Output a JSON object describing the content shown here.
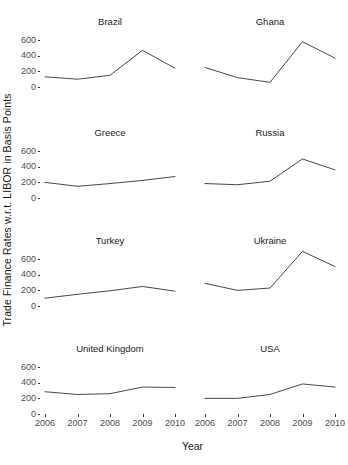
{
  "chart_data": {
    "type": "line",
    "title": "",
    "xlabel": "Year",
    "ylabel": "Trade Finance Rates w.r.t. LIBOR in Basis Points",
    "x": [
      2006,
      2007,
      2008,
      2009,
      2010
    ],
    "xtick_labels": [
      "2006",
      "2007",
      "2008",
      "2009",
      "2010"
    ],
    "ytick_labels": [
      "0",
      "200",
      "400",
      "600"
    ],
    "ytick_values": [
      0,
      200,
      400,
      600
    ],
    "ylim": [
      0,
      730
    ],
    "xlim": [
      2006,
      2010
    ],
    "grid": false,
    "legend": "none",
    "layout": "facet-grid 4 rows x 2 columns",
    "line_color": "#333333",
    "panels": [
      {
        "title": "Brazil",
        "row": 0,
        "col": 0,
        "values": [
          130,
          100,
          150,
          470,
          240
        ]
      },
      {
        "title": "Ghana",
        "row": 0,
        "col": 1,
        "values": [
          250,
          120,
          60,
          580,
          370
        ]
      },
      {
        "title": "Greece",
        "row": 1,
        "col": 0,
        "values": [
          200,
          150,
          185,
          225,
          275
        ]
      },
      {
        "title": "Russia",
        "row": 1,
        "col": 1,
        "values": [
          185,
          170,
          215,
          500,
          360
        ]
      },
      {
        "title": "Turkey",
        "row": 2,
        "col": 0,
        "values": [
          100,
          150,
          195,
          250,
          190
        ]
      },
      {
        "title": "Ukraine",
        "row": 2,
        "col": 1,
        "values": [
          290,
          200,
          230,
          700,
          505
        ]
      },
      {
        "title": "United Kingdom",
        "row": 3,
        "col": 0,
        "values": [
          285,
          250,
          260,
          345,
          340
        ]
      },
      {
        "title": "USA",
        "row": 3,
        "col": 1,
        "values": [
          200,
          200,
          250,
          385,
          345
        ]
      }
    ]
  },
  "axes": {
    "y_title": "Trade Finance Rates w.r.t. LIBOR in Basis Points",
    "x_title": "Year"
  }
}
